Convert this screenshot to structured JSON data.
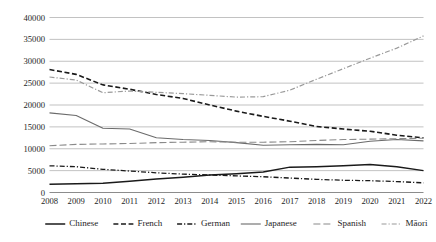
{
  "chart_data": {
    "type": "line",
    "title": "",
    "subtitle": "",
    "xlabel": "",
    "ylabel": "",
    "grid": "horizontal",
    "legend_position": "bottom",
    "xlim": [
      2008,
      2022
    ],
    "ylim": [
      0,
      40000
    ],
    "ytick_step": 5000,
    "categories": [
      "2008",
      "2009",
      "2010",
      "2011",
      "2012",
      "2013",
      "2014",
      "2015",
      "2016",
      "2017",
      "2018",
      "2019",
      "2020",
      "2021",
      "2022"
    ],
    "ytick_labels": [
      "0",
      "5000",
      "10000",
      "15000",
      "20000",
      "25000",
      "30000",
      "35000",
      "40000"
    ],
    "series": [
      {
        "name": "Chinese",
        "style": "solid",
        "color": "#1a1a1a",
        "width": 1.5,
        "values": [
          1900,
          2000,
          2100,
          2600,
          3100,
          3500,
          4000,
          4300,
          4700,
          5800,
          5900,
          6100,
          6400,
          5900,
          5000
        ]
      },
      {
        "name": "French",
        "style": "dashed",
        "color": "#1a1a1a",
        "width": 1.6,
        "values": [
          28100,
          27000,
          24600,
          23600,
          22400,
          21500,
          20000,
          18600,
          17400,
          16300,
          15100,
          14500,
          14000,
          13100,
          12500
        ]
      },
      {
        "name": "German",
        "style": "dash-dot",
        "color": "#1a1a1a",
        "width": 1.3,
        "values": [
          6100,
          5900,
          5300,
          4900,
          4500,
          4200,
          4000,
          3800,
          3600,
          3300,
          3000,
          2800,
          2700,
          2500,
          2200
        ]
      },
      {
        "name": "Japanese",
        "style": "solid",
        "color": "#6b6b6b",
        "width": 1.1,
        "values": [
          18200,
          17600,
          14700,
          14500,
          12500,
          12100,
          11900,
          11400,
          10800,
          10900,
          11000,
          10900,
          11700,
          12100,
          11800
        ]
      },
      {
        "name": "Spanish",
        "style": "long-dash",
        "color": "#8a8a8a",
        "width": 1.1,
        "values": [
          10700,
          11000,
          11100,
          11200,
          11400,
          11500,
          11600,
          11500,
          11500,
          11600,
          11900,
          12100,
          12200,
          12300,
          12400
        ]
      },
      {
        "name": "Māori",
        "style": "dash-dot",
        "color": "#9a9a9a",
        "width": 1.2,
        "values": [
          26400,
          25700,
          22800,
          23200,
          22900,
          22600,
          22200,
          21800,
          21900,
          23400,
          25900,
          28300,
          30700,
          33000,
          35800
        ]
      }
    ]
  },
  "legend": {
    "items": [
      {
        "label": "Chinese"
      },
      {
        "label": "French"
      },
      {
        "label": "German"
      },
      {
        "label": "Japanese"
      },
      {
        "label": "Spanish"
      },
      {
        "label": "Māori"
      }
    ]
  }
}
